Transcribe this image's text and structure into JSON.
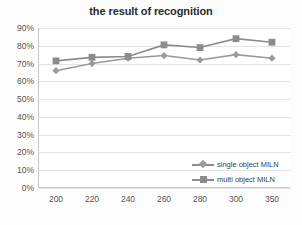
{
  "chart_data": {
    "type": "line",
    "title": "the result of recognition",
    "xlabel": "",
    "ylabel": "",
    "categories": [
      "200",
      "220",
      "240",
      "260",
      "280",
      "300",
      "350"
    ],
    "ylim": [
      0,
      90
    ],
    "ytick_labels": [
      "90%",
      "80%",
      "70%",
      "60%",
      "50%",
      "40%",
      "30%",
      "20%",
      "10%",
      "0%"
    ],
    "ytick_values": [
      90,
      80,
      70,
      60,
      50,
      40,
      30,
      20,
      10,
      0
    ],
    "grid": true,
    "legend_position": "inside-bottom-right",
    "series": [
      {
        "name": "single object MILN",
        "marker": "diamond",
        "color": "#9a9a9a",
        "values": [
          66,
          70,
          73,
          74.5,
          72,
          75,
          73
        ]
      },
      {
        "name": "multi object MILN",
        "marker": "square",
        "color": "#8c8c8c",
        "values": [
          71.5,
          73.5,
          74,
          80.5,
          79,
          84,
          82
        ]
      }
    ]
  },
  "colors": {
    "series_single": "#9a9a9a",
    "series_multi": "#8c8c8c",
    "grid": "#e4e4e4",
    "axis": "#c9c9c9",
    "title_text": "#2b2b2b",
    "tick_text": "#555555",
    "background": "#fdfdfd",
    "plot_background": "#ffffff"
  }
}
